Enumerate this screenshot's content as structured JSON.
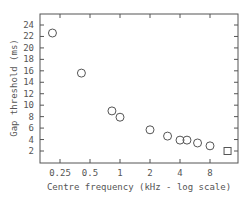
{
  "chart_data": {
    "type": "scatter",
    "title": "",
    "xlabel": "Centre frequency (kHz - log scale)",
    "ylabel": "Gap threshold (ms)",
    "x_scale": "log2",
    "x_ticks": [
      0.25,
      0.5,
      1,
      2,
      4,
      8
    ],
    "x_tick_labels": [
      "0.25",
      "0.5",
      "1",
      "2",
      "4",
      "8"
    ],
    "y_ticks": [
      2,
      4,
      6,
      8,
      10,
      12,
      14,
      16,
      18,
      20,
      22,
      24
    ],
    "y_tick_labels": [
      "2",
      "4",
      "6",
      "8",
      "10",
      "12",
      "14",
      "16",
      "18",
      "20",
      "22",
      "24"
    ],
    "xlim": [
      0.17,
      16
    ],
    "ylim": [
      -0.1,
      26
    ],
    "grid": false,
    "legend": null,
    "series": [
      {
        "name": "narrowband noise",
        "marker": "circle",
        "x": [
          0.21,
          0.41,
          0.83,
          1.0,
          2.0,
          3.0,
          4.0,
          4.7,
          6.0,
          8.0
        ],
        "y": [
          22.6,
          15.6,
          9.0,
          7.9,
          5.7,
          4.6,
          3.9,
          3.9,
          3.4,
          2.9
        ]
      },
      {
        "name": "broadband noise",
        "marker": "square",
        "x": [
          12.0
        ],
        "y": [
          2.0
        ]
      }
    ]
  }
}
